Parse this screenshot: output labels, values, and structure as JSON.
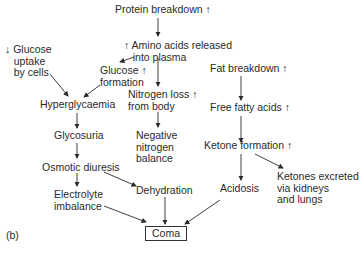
{
  "diagram": {
    "panel_label": "(b)",
    "nodes": {
      "protein_breakdown": "Protein breakdown ↑",
      "amino_acids": "↑ Amino acids released\n   into plasma",
      "glucose_uptake": "↓ Glucose\n   uptake\n   by cells",
      "glucose_formation": "Glucose ↑\nformation",
      "nitrogen_loss": "Nitrogen loss ↑\nfrom body",
      "hyperglycaemia": "Hyperglycaemia",
      "glycosuria": "Glycosuria",
      "negative_nitrogen": "Negative\nnitrogen\nbalance",
      "osmotic_diuresis": "Osmotic diuresis",
      "electrolyte": "Electrolyte\nimbalance",
      "dehydration": "Dehydration",
      "fat_breakdown": "Fat breakdown ↑",
      "free_fatty_acids": "Free fatty acids ↑",
      "ketone_formation": "Ketone formation ↑",
      "acidosis": "Acidosis",
      "ketones_excreted": "Ketones excreted\nvia kidneys\nand lungs",
      "coma": "Coma"
    }
  }
}
